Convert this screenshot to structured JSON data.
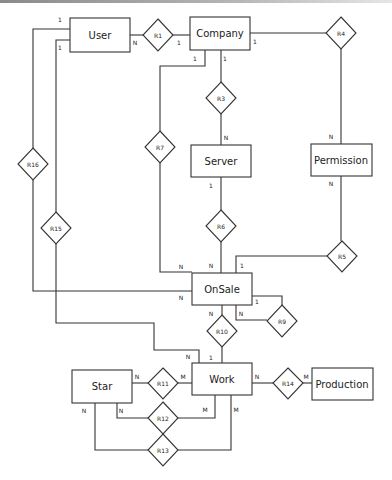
{
  "diagram": {
    "type": "er-diagram",
    "entities": [
      {
        "id": "user",
        "label": "User"
      },
      {
        "id": "company",
        "label": "Company"
      },
      {
        "id": "server",
        "label": "Server"
      },
      {
        "id": "permission",
        "label": "Permission"
      },
      {
        "id": "onsale",
        "label": "OnSale"
      },
      {
        "id": "work",
        "label": "Work"
      },
      {
        "id": "star",
        "label": "Star"
      },
      {
        "id": "production",
        "label": "Production"
      }
    ],
    "relationships": [
      {
        "id": "r1",
        "label": "R1",
        "from": "User",
        "to": "Company",
        "from_card": "N",
        "to_card": "1"
      },
      {
        "id": "r3",
        "label": "R3",
        "from": "Company",
        "to": "Server",
        "from_card": "1",
        "to_card": "N"
      },
      {
        "id": "r4",
        "label": "R4",
        "from": "Company",
        "to": "Permission",
        "from_card": "1",
        "to_card": "N"
      },
      {
        "id": "r5",
        "label": "R5",
        "from": "Permission",
        "to": "OnSale",
        "from_card": "N",
        "to_card": "1"
      },
      {
        "id": "r6",
        "label": "R6",
        "from": "Server",
        "to": "OnSale",
        "from_card": "1",
        "to_card": "N"
      },
      {
        "id": "r7",
        "label": "R7",
        "from": "Company",
        "to": "OnSale",
        "from_card": "1",
        "to_card": "N"
      },
      {
        "id": "r9",
        "label": "R9",
        "from": "OnSale",
        "to": "OnSale",
        "from_card": "1",
        "to_card": "N"
      },
      {
        "id": "r10",
        "label": "R10",
        "from": "OnSale",
        "to": "Work",
        "from_card": "N",
        "to_card": "1"
      },
      {
        "id": "r11",
        "label": "R11",
        "from": "Star",
        "to": "Work",
        "from_card": "N",
        "to_card": "M"
      },
      {
        "id": "r12",
        "label": "R12",
        "from": "Star",
        "to": "Work",
        "from_card": "N",
        "to_card": "M"
      },
      {
        "id": "r13",
        "label": "R13",
        "from": "Star",
        "to": "Work",
        "from_card": "N",
        "to_card": "M"
      },
      {
        "id": "r14",
        "label": "R14",
        "from": "Work",
        "to": "Production",
        "from_card": "N",
        "to_card": "M"
      },
      {
        "id": "r15",
        "label": "R15",
        "from": "User",
        "to": "Work",
        "from_card": "1",
        "to_card": "N"
      },
      {
        "id": "r16",
        "label": "R16",
        "from": "User",
        "to": "OnSale",
        "from_card": "1",
        "to_card": "N"
      }
    ]
  },
  "labels": {
    "user": "User",
    "company": "Company",
    "server": "Server",
    "permission": "Permission",
    "onsale": "OnSale",
    "work": "Work",
    "star": "Star",
    "production": "Production",
    "r1": "R1",
    "r3": "R3",
    "r4": "R4",
    "r5": "R5",
    "r6": "R6",
    "r7": "R7",
    "r9": "R9",
    "r10": "R10",
    "r11": "R11",
    "r12": "R12",
    "r13": "R13",
    "r14": "R14",
    "r15": "R15",
    "r16": "R16",
    "one": "1",
    "n": "N",
    "m": "M"
  }
}
